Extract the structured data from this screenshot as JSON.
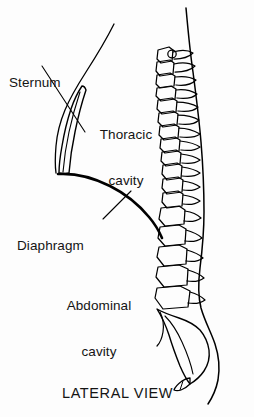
{
  "figure": {
    "caption": "LATERAL VIEW",
    "background_color": "#fdfdfd",
    "ink_color": "#000000",
    "width": 254,
    "height": 417
  },
  "labels": {
    "sternum": {
      "text": "Sternum",
      "lines": [
        "Sternum"
      ]
    },
    "thoracic_cavity": {
      "text": "Thoracic cavity",
      "lines": [
        "Thoracic",
        "cavity"
      ]
    },
    "diaphragm": {
      "text": "Diaphragm",
      "lines": [
        "Diaphragm"
      ]
    },
    "abdominal_cavity": {
      "text": "Abdominal cavity",
      "lines": [
        "Abdominal",
        "cavity"
      ]
    }
  },
  "structures": [
    "sternum",
    "thoracic-cavity",
    "diaphragm",
    "abdominal-cavity",
    "vertebral-column",
    "sacrum",
    "coccyx",
    "back-body-outline",
    "chest-front-outline"
  ]
}
